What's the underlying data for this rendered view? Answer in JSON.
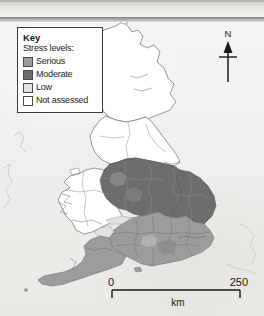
{
  "map": {
    "title": "Water stress levels map of Great Britain",
    "key": {
      "title": "Key",
      "subtitle": "Stress levels:",
      "items": [
        {
          "label": "Serious",
          "color": "#9c9c9c"
        },
        {
          "label": "Moderate",
          "color": "#6d6d6d"
        },
        {
          "label": "Low",
          "color": "#e2e2e2"
        },
        {
          "label": "Not assessed",
          "color": "#ffffff"
        }
      ]
    },
    "north_arrow": {
      "label": "N",
      "icon": "north-arrow-icon"
    },
    "scale_bar": {
      "min_label": "0",
      "max_label": "250",
      "unit_label": "km"
    },
    "colors": {
      "serious": "#9c9c9c",
      "moderate": "#6d6d6d",
      "low": "#e2e2e2",
      "not_assessed": "#ffffff",
      "coastline": "#6b6b6b",
      "region_border": "#7d7d7d",
      "background": "#f2f1ef"
    },
    "regions": [
      {
        "name": "Scotland",
        "stress": "Not assessed"
      },
      {
        "name": "Wales",
        "stress": "Not assessed"
      },
      {
        "name": "Northern England",
        "stress": "Not assessed"
      },
      {
        "name": "North West England",
        "stress": "Moderate"
      },
      {
        "name": "Midlands",
        "stress": "Moderate"
      },
      {
        "name": "East Anglia",
        "stress": "Moderate"
      },
      {
        "name": "South East England",
        "stress": "Serious"
      },
      {
        "name": "Thames Valley",
        "stress": "Serious"
      },
      {
        "name": "South West England",
        "stress": "Serious"
      },
      {
        "name": "Southern England",
        "stress": "Low"
      }
    ]
  }
}
